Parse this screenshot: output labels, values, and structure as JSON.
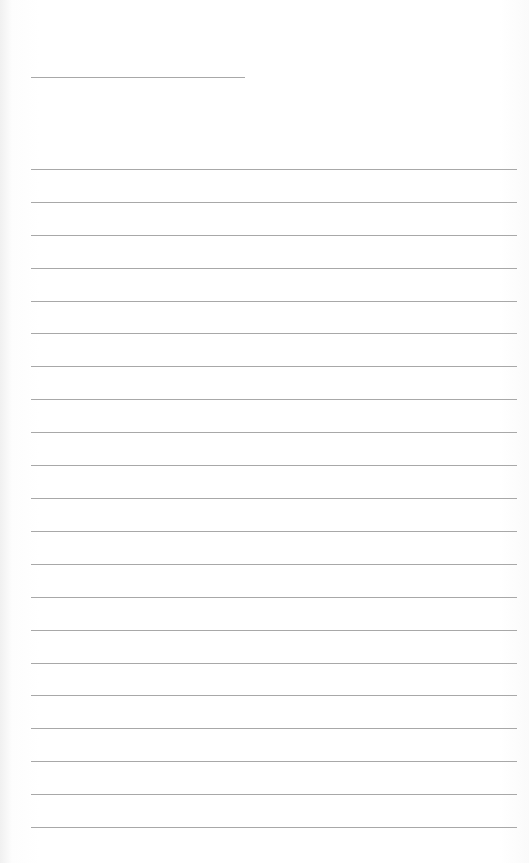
{
  "page": {
    "type": "lined-paper",
    "background_color": "#ffffff",
    "line_color": "#a8a8a8",
    "title_line": {
      "present": true
    },
    "ruled_line_count": 21,
    "ruled_lines": [
      169,
      202,
      235,
      268,
      301,
      333,
      366,
      399,
      432,
      465,
      498,
      531,
      564,
      597,
      630,
      663,
      695,
      728,
      761,
      794,
      827
    ]
  }
}
